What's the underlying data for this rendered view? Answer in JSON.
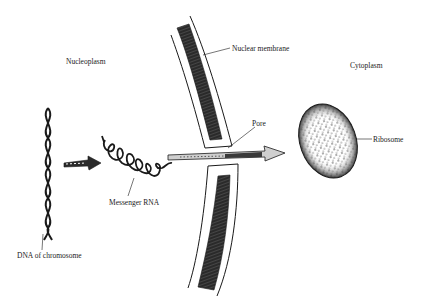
{
  "diagram": {
    "title": "",
    "regions": {
      "nucleoplasm": "Nucleoplasm",
      "cytoplasm": "Cytoplasm"
    },
    "labels": {
      "nuclear_membrane": "Nuclear membrane",
      "pore": "Pore",
      "ribosome": "Ribosome",
      "messenger_rna": "Messenger RNA",
      "dna": "DNA of chromosome"
    },
    "colors": {
      "ink": "#1a1a1a",
      "background": "#ffffff"
    }
  }
}
